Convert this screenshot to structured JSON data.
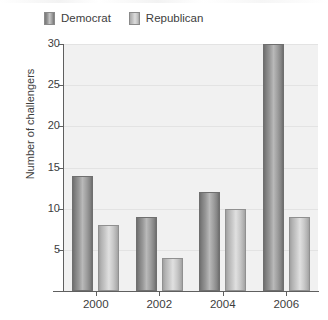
{
  "chart_data": {
    "type": "bar",
    "title": "",
    "xlabel": "",
    "ylabel": "Number of challengers",
    "categories": [
      "2000",
      "2002",
      "2004",
      "2006"
    ],
    "series": [
      {
        "name": "Democrat",
        "color": "#8f8f8f",
        "values": [
          14,
          9,
          12,
          30
        ]
      },
      {
        "name": "Republican",
        "color": "#c8c8c8",
        "values": [
          8,
          4,
          10,
          9
        ]
      }
    ],
    "ylim": [
      0,
      30
    ],
    "yticks": [
      5,
      10,
      15,
      20,
      25,
      30
    ],
    "ytick_labels": [
      "5",
      "10",
      "15",
      "20",
      "25",
      "30"
    ],
    "grid": true,
    "legend_position": "top-left",
    "plot_background": "#f1f1f1",
    "gridline_color": "#e3e3e3",
    "axis_color": "#5f5f5f"
  },
  "legend": {
    "items": [
      {
        "label": "Democrat"
      },
      {
        "label": "Republican"
      }
    ]
  },
  "axes": {
    "y_title": "Number of challengers"
  }
}
